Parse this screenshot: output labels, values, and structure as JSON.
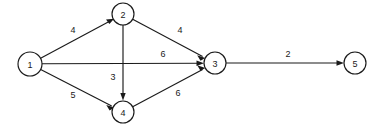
{
  "diagram": {
    "type": "directed-weighted-graph",
    "title": "",
    "background_color": "#ffffff",
    "stroke_color": "#1a1a1a",
    "nodes": [
      {
        "id": "1",
        "label": "1",
        "x": 30,
        "y": 64,
        "r": 12
      },
      {
        "id": "2",
        "label": "2",
        "x": 123,
        "y": 14,
        "r": 11
      },
      {
        "id": "3",
        "label": "3",
        "x": 215,
        "y": 63,
        "r": 11
      },
      {
        "id": "4",
        "label": "4",
        "x": 123,
        "y": 112,
        "r": 11
      },
      {
        "id": "5",
        "label": "5",
        "x": 355,
        "y": 63,
        "r": 11
      }
    ],
    "edges": [
      {
        "id": "e1",
        "from": "1",
        "to": "2",
        "weight": "4",
        "label_x": 73,
        "label_y": 30
      },
      {
        "id": "e2",
        "from": "1",
        "to": "3",
        "weight": "6",
        "label_x": 163,
        "label_y": 54
      },
      {
        "id": "e3",
        "from": "1",
        "to": "4",
        "weight": "5",
        "label_x": 73,
        "label_y": 95
      },
      {
        "id": "e4",
        "from": "2",
        "to": "3",
        "weight": "4",
        "label_x": 180,
        "label_y": 30
      },
      {
        "id": "e5",
        "from": "2",
        "to": "4",
        "weight": "3",
        "label_x": 113,
        "label_y": 77
      },
      {
        "id": "e6",
        "from": "4",
        "to": "3",
        "weight": "6",
        "label_x": 178,
        "label_y": 93
      },
      {
        "id": "e7",
        "from": "3",
        "to": "5",
        "weight": "2",
        "label_x": 288,
        "label_y": 54
      }
    ]
  }
}
